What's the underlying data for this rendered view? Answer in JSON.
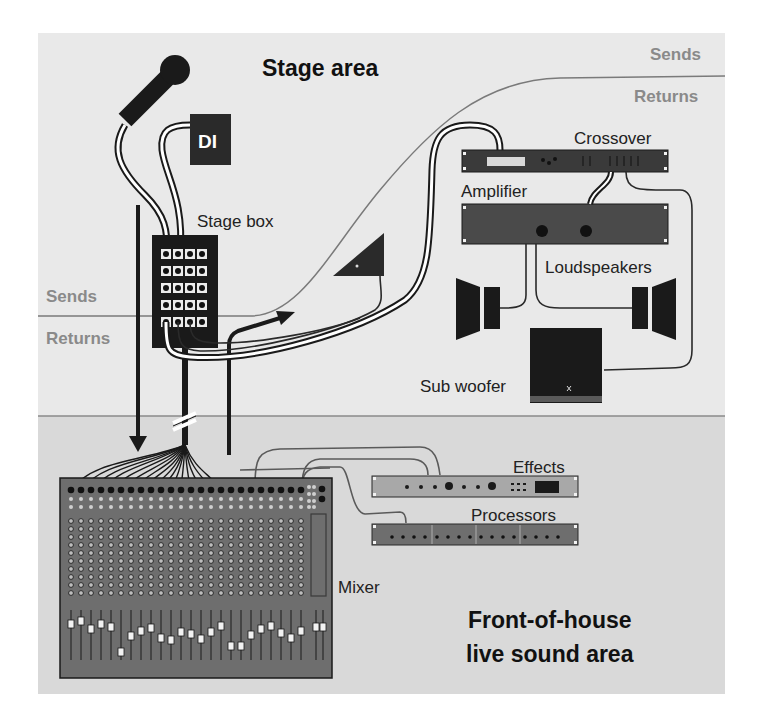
{
  "diagram": {
    "areas": {
      "stage": {
        "label": "Stage area",
        "fill": "#e9e9e9"
      },
      "foh": {
        "label_line1": "Front-of-house",
        "label_line2": "live sound area",
        "fill": "#d9d9d9"
      }
    },
    "snake_labels": {
      "left_sends": "Sends",
      "left_returns": "Returns",
      "right_sends": "Sends",
      "right_returns": "Returns"
    },
    "devices": {
      "di": "DI",
      "stage_box": "Stage box",
      "crossover": "Crossover",
      "amplifier": "Amplifier",
      "loudspeakers": "Loudspeakers",
      "sub_woofer": "Sub woofer",
      "effects": "Effects",
      "processors": "Processors",
      "mixer": "Mixer"
    },
    "colors": {
      "device_dark": "#1a1a1a",
      "device_mid": "#6e6e6e",
      "rack_light": "#a8a8a8",
      "line_gray": "#7a7a7a",
      "cable": "#2a2a2a"
    },
    "stage_box_grid": {
      "rows": 5,
      "cols": 4
    },
    "mixer": {
      "channels": 24,
      "stereo_master_faders": 2
    }
  }
}
